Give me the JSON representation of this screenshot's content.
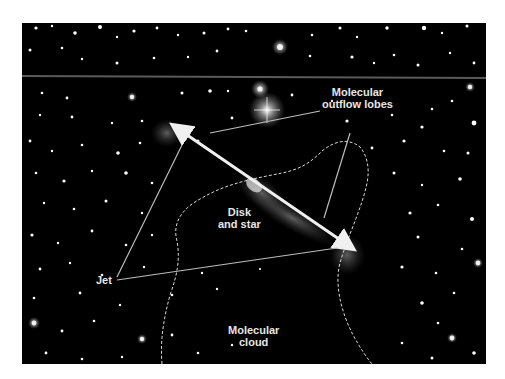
{
  "figure": {
    "labels": {
      "outflow_line1": "Molecular",
      "outflow_line2": "outflow lobes",
      "disk_line1": "Disk",
      "disk_line2": "and star",
      "jet": "Jet",
      "cloud_line1": "Molecular",
      "cloud_line2": "cloud"
    },
    "colors": {
      "background": "#000000",
      "label_text": "#e6e6e6",
      "arrow": "#f0f0f0",
      "leader_lines": "#bdbdbd",
      "cloud_boundary": "#d8d8d8"
    }
  }
}
